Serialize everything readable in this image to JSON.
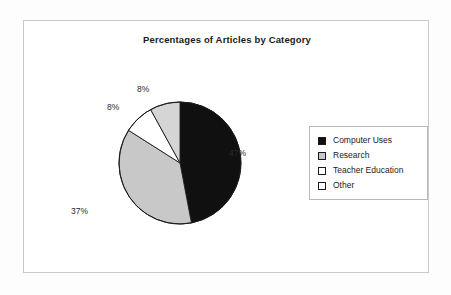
{
  "chart_data": {
    "type": "pie",
    "title": "Percentages of Articles by Category",
    "xlabel": "",
    "ylabel": "",
    "legend_position": "right",
    "grid": false,
    "start_angle_deg": 0,
    "direction": "clockwise",
    "categories": [
      "Computer Uses",
      "Research",
      "Teacher Education",
      "Other"
    ],
    "values": [
      47,
      37,
      8,
      8
    ],
    "data_labels": [
      "47%",
      "37%",
      "8%",
      "8%"
    ],
    "slice_colors": [
      "#101010",
      "#c8c8c8",
      "#ffffff",
      "#d5d5d5"
    ],
    "slices": [
      {
        "label": "Computer Uses",
        "value": 47,
        "data_label": "47%",
        "color": "#101010"
      },
      {
        "label": "Research",
        "value": 37,
        "data_label": "37%",
        "color": "#c8c8c8"
      },
      {
        "label": "Teacher Education",
        "value": 8,
        "data_label": "8%",
        "color": "#ffffff"
      },
      {
        "label": "Other",
        "value": 8,
        "data_label": "8%",
        "color": "#d5d5d5"
      }
    ]
  },
  "chart": {
    "title": "Percentages of Articles by Category"
  },
  "labels": {
    "computer_uses": "47%",
    "research": "37%",
    "teacher_education": "8%",
    "other": "8%"
  },
  "legend": {
    "items": [
      {
        "label": "Computer Uses",
        "swatch": "#101010"
      },
      {
        "label": "Research",
        "swatch": "#c8c8c8"
      },
      {
        "label": "Teacher Education",
        "swatch": "#ffffff"
      },
      {
        "label": "Other",
        "swatch": "#ffffff"
      }
    ]
  },
  "colors": {
    "slice_black": "#101010",
    "slice_gray": "#c8c8c8",
    "slice_white": "#ffffff",
    "outline": "#1b1b1b",
    "frame": "#c9c9c9"
  }
}
